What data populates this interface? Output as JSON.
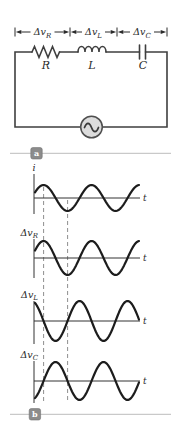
{
  "circuit": {
    "dimension_labels": [
      {
        "base": "Δv",
        "sub": "R"
      },
      {
        "base": "Δv",
        "sub": "L"
      },
      {
        "base": "Δv",
        "sub": "C"
      }
    ],
    "components": [
      {
        "symbol": "R",
        "type": "resistor"
      },
      {
        "symbol": "L",
        "type": "inductor"
      },
      {
        "symbol": "C",
        "type": "capacitor"
      }
    ],
    "source_icon": "ac-sine-source"
  },
  "badges": {
    "a": "a",
    "b": "b"
  },
  "colors": {
    "wire": "#3f3f3f",
    "curve": "#1c1c1c",
    "dashed_line": "#8f8f8f",
    "divider": "#c9c9c9",
    "badge_bg": "#8c8c8c",
    "badge_text": "#ffffff",
    "source_fill": "#dcdcdc",
    "text": "#2a2a2a"
  },
  "chart_data": {
    "type": "line",
    "x_axis_label": "t",
    "plots": [
      {
        "name": "current",
        "y_label": {
          "base": "i",
          "sub": ""
        },
        "t_label": "t",
        "phase_deg": 0,
        "amplitude": 13,
        "axis_y": 198,
        "label_x": 34,
        "label_y": 171,
        "label_anchor": "middle"
      },
      {
        "name": "resistor-voltage",
        "y_label": {
          "base": "Δv",
          "sub": "R"
        },
        "t_label": "t",
        "phase_deg": 0,
        "amplitude": 17,
        "axis_y": 258,
        "label_x": 38,
        "label_y": 236,
        "label_anchor": "end"
      },
      {
        "name": "inductor-voltage",
        "y_label": {
          "base": "Δv",
          "sub": "L"
        },
        "t_label": "t",
        "phase_deg": 90,
        "amplitude": 20,
        "axis_y": 321,
        "label_x": 38,
        "label_y": 298,
        "label_anchor": "end"
      },
      {
        "name": "capacitor-voltage",
        "y_label": {
          "base": "Δv",
          "sub": "C"
        },
        "t_label": "t",
        "phase_deg": -90,
        "amplitude": 19,
        "axis_y": 381,
        "label_x": 38,
        "label_y": 358,
        "label_anchor": "end"
      }
    ],
    "x_origin": 35,
    "x_end": 139,
    "axis_x": 34,
    "h_axis_end": 140,
    "period_px": 48,
    "phase_lead_rad": 0.45,
    "dashed_lines_x": [
      43.6,
      67.6
    ],
    "phase_relationships": "Δv_R in phase with i; Δv_L leads i by 90°; Δv_C lags i by 90°"
  }
}
